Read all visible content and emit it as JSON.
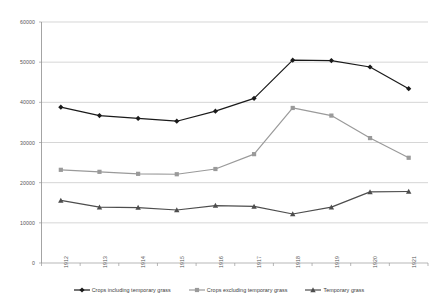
{
  "chart_data": {
    "type": "line",
    "title": "",
    "subtitle": "",
    "xlabel": "",
    "ylabel": "",
    "categories": [
      "1912",
      "1913",
      "1914",
      "1915",
      "1916",
      "1917",
      "1918",
      "1919",
      "1920",
      "1921"
    ],
    "ylim": [
      0,
      60000
    ],
    "y_ticks": [
      "0",
      "10000",
      "20000",
      "30000",
      "40000",
      "50000",
      "60000"
    ],
    "y_tick_values": [
      0,
      10000,
      20000,
      30000,
      40000,
      50000,
      60000
    ],
    "grid": "horizontal",
    "legend_position": "bottom",
    "series": [
      {
        "name": "Crops including temporary grass",
        "color": "#1a1a1a",
        "marker": "diamond",
        "values": [
          38800,
          36700,
          36000,
          35300,
          37800,
          41000,
          50500,
          50400,
          48800,
          43400
        ]
      },
      {
        "name": "Crops excluding temporary grass",
        "color": "#9a9a9a",
        "marker": "square",
        "values": [
          23200,
          22700,
          22200,
          22100,
          23400,
          27100,
          38600,
          36700,
          31100,
          26200
        ]
      },
      {
        "name": "Temporary grass",
        "color": "#4d4d4d",
        "marker": "triangle",
        "values": [
          15600,
          13900,
          13800,
          13200,
          14300,
          14100,
          12200,
          13900,
          17700,
          17800
        ]
      }
    ]
  },
  "legend": {
    "items": [
      {
        "label": "Crops including temporary grass"
      },
      {
        "label": "Crops excluding temporary grass"
      },
      {
        "label": "Temporary grass"
      }
    ]
  }
}
